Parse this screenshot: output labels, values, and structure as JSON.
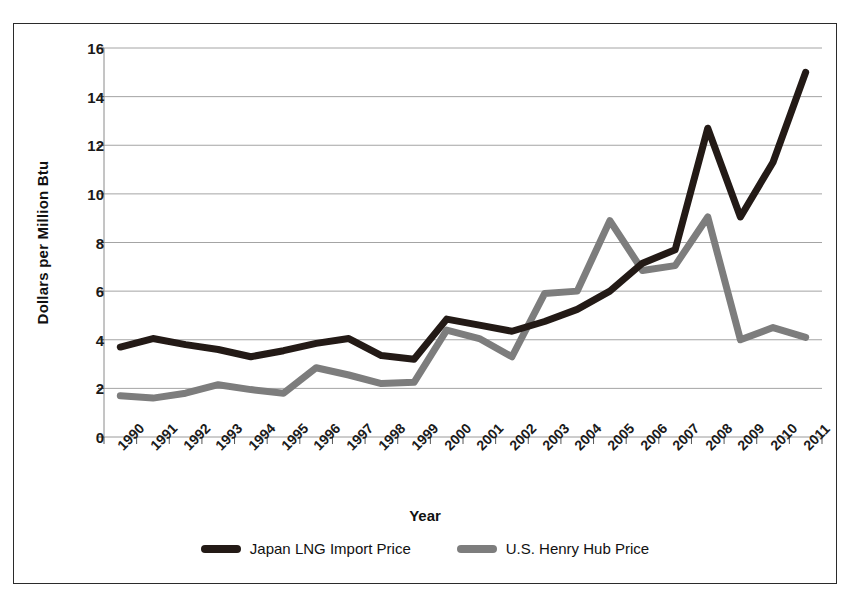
{
  "chart_data": {
    "type": "line",
    "title": "",
    "xlabel": "Year",
    "ylabel": "Dollars per Million Btu",
    "categories": [
      "1990",
      "1991",
      "1992",
      "1993",
      "1994",
      "1995",
      "1996",
      "1997",
      "1998",
      "1999",
      "2000",
      "2001",
      "2002",
      "2003",
      "2004",
      "2005",
      "2006",
      "2007",
      "2008",
      "2009",
      "2010",
      "2011"
    ],
    "ylim": [
      0,
      16
    ],
    "yticks": [
      0,
      2,
      4,
      6,
      8,
      10,
      12,
      14,
      16
    ],
    "grid": true,
    "legend_position": "bottom",
    "series": [
      {
        "name": "Japan LNG Import Price",
        "color": "#231a16",
        "values": [
          3.7,
          4.05,
          3.8,
          3.6,
          3.3,
          3.55,
          3.85,
          4.05,
          3.35,
          3.2,
          4.85,
          4.6,
          4.35,
          4.75,
          5.25,
          6.0,
          7.15,
          7.7,
          12.7,
          9.05,
          11.3,
          15.0
        ]
      },
      {
        "name": "U.S. Henry Hub Price",
        "color": "#7d7d7d",
        "values": [
          1.7,
          1.6,
          1.8,
          2.15,
          1.95,
          1.8,
          2.85,
          2.55,
          2.2,
          2.25,
          4.4,
          4.05,
          3.3,
          5.9,
          6.0,
          8.9,
          6.85,
          7.05,
          9.05,
          4.0,
          4.5,
          4.1
        ]
      }
    ]
  },
  "axis": {
    "y_title": "Dollars per Million Btu",
    "x_title": "Year"
  },
  "legend": {
    "items": [
      {
        "label": "Japan LNG Import Price",
        "color": "#231a16"
      },
      {
        "label": "U.S. Henry Hub Price",
        "color": "#7d7d7d"
      }
    ]
  }
}
